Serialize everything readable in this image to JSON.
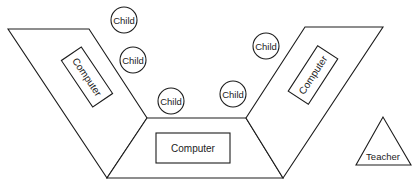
{
  "diagram": {
    "colors": {
      "line": "#1c1c1c",
      "background": "#ffffff"
    },
    "tables": [
      {
        "id": "left",
        "computer_label": "Computer"
      },
      {
        "id": "bottom",
        "computer_label": "Computer"
      },
      {
        "id": "right",
        "computer_label": "Computer"
      }
    ],
    "children": [
      {
        "label": "Child"
      },
      {
        "label": "Child"
      },
      {
        "label": "Child"
      },
      {
        "label": "Child"
      },
      {
        "label": "Child"
      },
      {
        "label": "Child"
      }
    ],
    "teacher": {
      "label": "Teacher"
    }
  }
}
